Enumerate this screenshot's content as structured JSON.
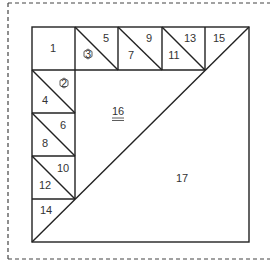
{
  "diagram": {
    "stroke_color": "#222222",
    "dashed_border_color": "#444444",
    "labels": {
      "p1": "1",
      "p2": "2",
      "p3": "3",
      "p4": "4",
      "p5": "5",
      "p6": "6",
      "p7": "7",
      "p8": "8",
      "p9": "9",
      "p10": "10",
      "p11": "11",
      "p12": "12",
      "p13": "13",
      "p14": "14",
      "p15": "15",
      "p16": "16",
      "p17": "17"
    },
    "marked_pieces": [
      {
        "label": "2",
        "marker": "hexagon"
      },
      {
        "label": "3",
        "marker": "hexagon"
      },
      {
        "label": "16",
        "marker": "double-underline"
      }
    ]
  }
}
